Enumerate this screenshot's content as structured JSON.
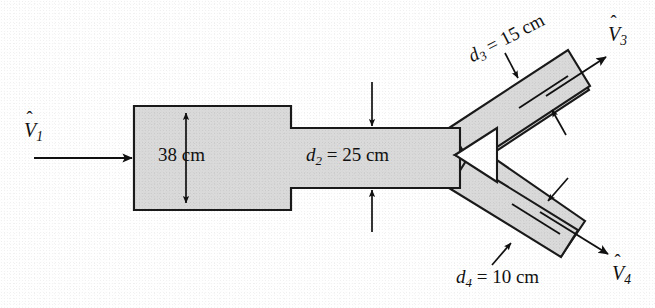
{
  "figure": {
    "background_color": "#ffffff",
    "duct_fill_color": "#d9d9d9",
    "outline_color": "#1a1a1a"
  },
  "labels": {
    "inlet_velocity": {
      "symbol": "V",
      "accent": "hat",
      "subscript": "1"
    },
    "inlet_diameter": "38 cm",
    "throat_diameter": {
      "symbol": "d",
      "subscript": "2",
      "value": "= 25 cm",
      "full": "d2 = 25 cm"
    },
    "upper_branch_diameter": {
      "symbol": "d",
      "subscript": "3",
      "value": "= 15 cm",
      "full": "d3 = 15 cm"
    },
    "lower_branch_diameter": {
      "symbol": "d",
      "subscript": "4",
      "value": "= 10 cm",
      "full": "d4 = 10 cm"
    },
    "upper_outlet_velocity": {
      "symbol": "V",
      "accent": "hat",
      "subscript": "3"
    },
    "lower_outlet_velocity": {
      "symbol": "V",
      "accent": "hat",
      "subscript": "4"
    }
  },
  "geometry": {
    "inlet_section": {
      "x": 134,
      "y": 106,
      "width": 157,
      "height": 104,
      "diameter_cm": 38
    },
    "throat_section": {
      "x": 291,
      "y": 128,
      "width": 164,
      "height": 60,
      "diameter_cm": 25
    },
    "junction_notch": {
      "x": 455,
      "y": 155
    },
    "upper_branch": {
      "angle_deg": -27.5,
      "diameter_cm": 15,
      "outlet_x": 585,
      "outlet_y": 65
    },
    "lower_branch": {
      "angle_deg": 27.5,
      "diameter_cm": 10,
      "outlet_x": 580,
      "outlet_y": 255
    }
  }
}
